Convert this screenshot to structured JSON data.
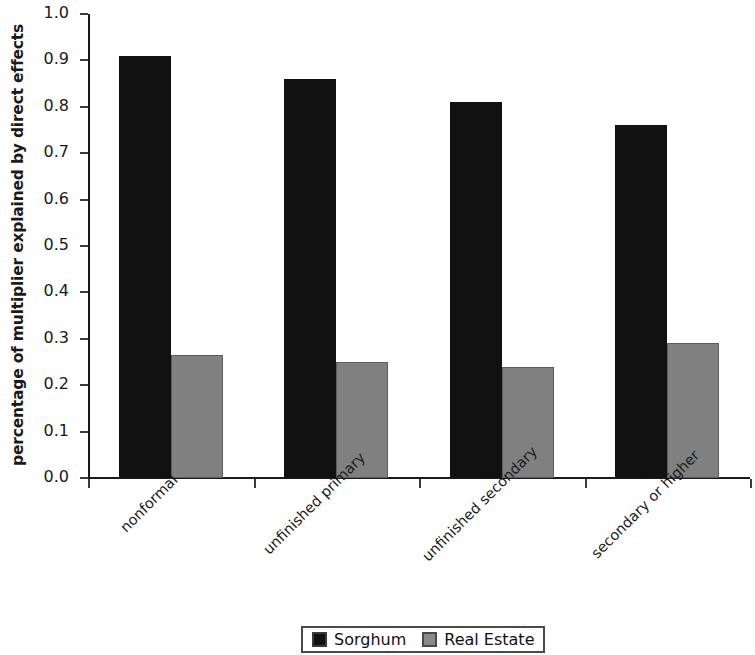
{
  "chart_data": {
    "type": "bar",
    "title": "",
    "xlabel": "",
    "ylabel": "percentage of multiplier explained by direct effects",
    "ylim": [
      0.0,
      1.0
    ],
    "ytick_labels": [
      "1.0",
      "0.9",
      "0.8",
      "0.7",
      "0.6",
      "0.5",
      "0.4",
      "0.3",
      "0.2",
      "0.1",
      "0.0"
    ],
    "ytick_values": [
      1.0,
      0.9,
      0.8,
      0.7,
      0.6,
      0.5,
      0.4,
      0.3,
      0.2,
      0.1,
      0.0
    ],
    "grid": false,
    "legend_position": "bottom-center",
    "categories": [
      "nonformal",
      "unfinished primary",
      "unfinished secondary",
      "secondary or higher"
    ],
    "series": [
      {
        "name": "Sorghum",
        "color": "#111111",
        "values": [
          0.91,
          0.86,
          0.81,
          0.76
        ]
      },
      {
        "name": "Real Estate",
        "color": "#808080",
        "values": [
          0.265,
          0.25,
          0.24,
          0.29
        ]
      }
    ]
  },
  "legend": {
    "entries": [
      {
        "label": "Sorghum"
      },
      {
        "label": "Real Estate"
      }
    ]
  }
}
